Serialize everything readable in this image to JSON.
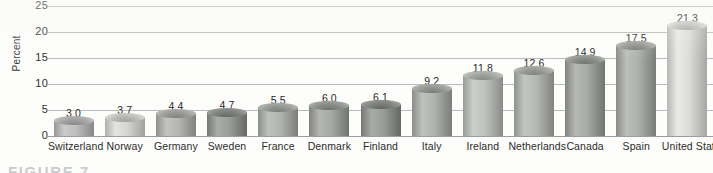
{
  "chart_data": {
    "type": "bar",
    "title": "",
    "xlabel": "",
    "ylabel": "Percent",
    "ylim": [
      0,
      25
    ],
    "yticks": [
      0,
      5,
      10,
      15,
      20,
      25
    ],
    "grid": true,
    "legend": false,
    "categories": [
      "Switzerland",
      "Norway",
      "Germany",
      "Sweden",
      "France",
      "Denmark",
      "Finland",
      "Italy",
      "Ireland",
      "Netherlands",
      "Canada",
      "Spain",
      "United States"
    ],
    "values": [
      3.0,
      3.7,
      4.4,
      4.7,
      5.5,
      6.0,
      6.1,
      9.2,
      11.8,
      12.6,
      14.9,
      17.5,
      21.3
    ],
    "value_labels": [
      "3.0",
      "3.7",
      "4.4",
      "4.7",
      "5.5",
      "6.0",
      "6.1",
      "9.2",
      "11.8",
      "12.6",
      "14.9",
      "17.5",
      "21.3"
    ],
    "bar_colors": [
      "#b0b1b0",
      "#c9c9c6",
      "#a9aaa8",
      "#8f918f",
      "#a5a7a5",
      "#9a9c9a",
      "#8e908e",
      "#a4a6a4",
      "#b2b4b2",
      "#a9aba9",
      "#9b9d9b",
      "#a2a4a2",
      "#cfd0ce"
    ]
  },
  "yaxis": {
    "title": "Percent",
    "tick_labels": [
      "0",
      "5",
      "10",
      "15",
      "20",
      "25"
    ]
  },
  "caption": {
    "text": "FIGURE 7"
  },
  "colors": {
    "gridline": "#b9bcbe",
    "baseline": "#9a9d9f",
    "text": "#2b2b2b",
    "background": "#fdfdfb"
  }
}
